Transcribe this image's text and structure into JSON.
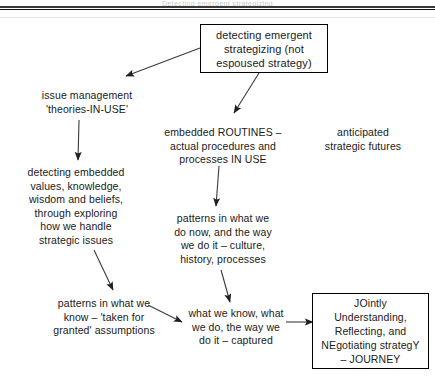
{
  "figure": {
    "header_ghost": "Detecting emergent strategizing"
  },
  "colors": {
    "text": "#1a1a1a",
    "stroke": "#3b3b3b",
    "box_border": "#000000",
    "background": "#ffffff",
    "rule": "#111111"
  },
  "nodes": {
    "top": {
      "id": "detecting-emergent-strategizing",
      "label": "detecting emergent\nstrategizing (not\nespoused strategy)",
      "boxed": true
    },
    "issue_management": {
      "id": "issue-management",
      "label": "issue management\n'theories-IN-USE'",
      "boxed": false
    },
    "embedded_routines": {
      "id": "embedded-routines",
      "label": "embedded ROUTINES –\nactual procedures and\nprocesses IN USE",
      "boxed": false
    },
    "anticipated_futures": {
      "id": "anticipated-strategic-futures",
      "label": "anticipated\nstrategic futures",
      "boxed": false
    },
    "detecting_embedded": {
      "id": "detecting-embedded-values",
      "label": "detecting embedded\nvalues, knowledge,\nwisdom and beliefs,\nthrough exploring\nhow we handle\nstrategic issues",
      "boxed": false
    },
    "patterns_now": {
      "id": "patterns-in-what-we-do-now",
      "label": "patterns in what we\ndo now, and the way\nwe do it – culture,\nhistory, processes",
      "boxed": false
    },
    "patterns_know": {
      "id": "patterns-in-what-we-know",
      "label": "patterns in what we\nknow – 'taken for\ngranted' assumptions",
      "boxed": false
    },
    "what_we_know": {
      "id": "what-we-know-what-we-do",
      "label": "what we know, what\nwe do, the way we\ndo it – captured",
      "boxed": false
    },
    "journey": {
      "id": "journey",
      "label": "JOintly\nUnderstanding,\nReflecting, and\nNEgotiating strategY\n– JOURNEY",
      "boxed": true
    }
  },
  "connectors": [
    {
      "id": "top-to-issue-management",
      "from": "top",
      "to": "issue_management",
      "style": "arrow"
    },
    {
      "id": "top-to-embedded-routines",
      "from": "top",
      "to": "embedded_routines",
      "style": "arrow"
    },
    {
      "id": "issue-to-detecting-embedded",
      "from": "issue_management",
      "to": "detecting_embedded",
      "style": "arrow"
    },
    {
      "id": "routines-to-patterns-now",
      "from": "embedded_routines",
      "to": "patterns_now",
      "style": "arrow"
    },
    {
      "id": "detecting-to-patterns-know",
      "from": "detecting_embedded",
      "to": "patterns_know",
      "style": "arrow"
    },
    {
      "id": "patterns-now-to-what-we-know",
      "from": "patterns_now",
      "to": "what_we_know",
      "style": "arrow"
    },
    {
      "id": "patterns-know-to-what-we-know",
      "from": "patterns_know",
      "to": "what_we_know",
      "style": "arrow"
    },
    {
      "id": "what-we-know-to-journey",
      "from": "what_we_know",
      "to": "journey",
      "style": "arrow"
    }
  ]
}
